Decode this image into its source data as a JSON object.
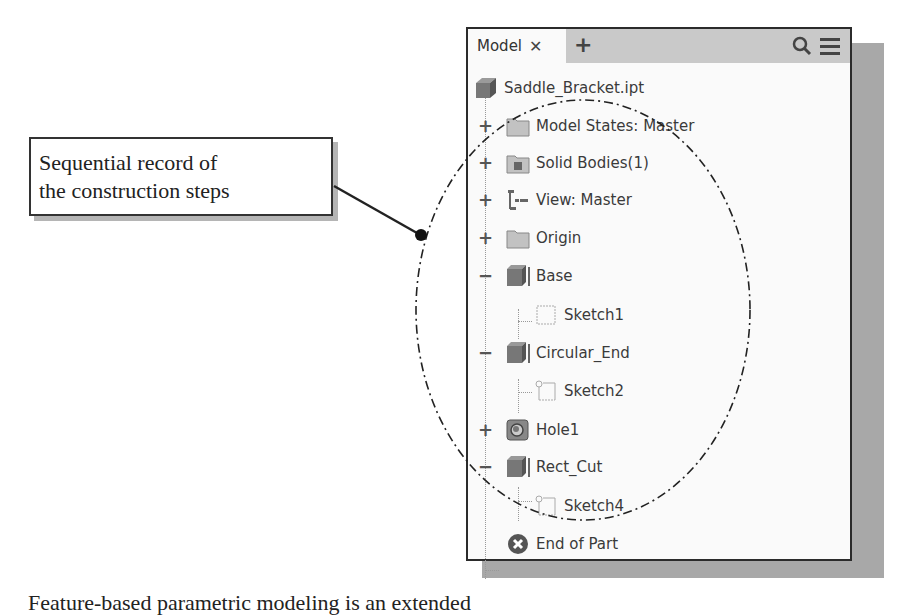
{
  "panel": {
    "tabs": [
      {
        "label": "Model",
        "close_icon": "close-icon"
      }
    ],
    "add_tab_icon": "plus-icon",
    "search_icon": "search-icon",
    "menu_icon": "hamburger-menu-icon"
  },
  "tree": {
    "root": {
      "label": "Saddle_Bracket.ipt",
      "icon": "part-icon"
    },
    "items": [
      {
        "label": "Model States: Master",
        "icon": "folder-icon",
        "expander": "+",
        "level": 1
      },
      {
        "label": "Solid Bodies(1)",
        "icon": "solid-bodies-folder-icon",
        "expander": "+",
        "level": 1
      },
      {
        "label": "View: Master",
        "icon": "view-rep-icon",
        "expander": "+",
        "level": 1
      },
      {
        "label": "Origin",
        "icon": "folder-icon",
        "expander": "+",
        "level": 1
      },
      {
        "label": "Base",
        "icon": "extrude-icon",
        "expander": "−",
        "level": 1
      },
      {
        "label": "Sketch1",
        "icon": "sketch-icon",
        "expander": "",
        "level": 2
      },
      {
        "label": "Circular_End",
        "icon": "extrude-icon",
        "expander": "−",
        "level": 1
      },
      {
        "label": "Sketch2",
        "icon": "sketch-icon",
        "expander": "",
        "level": 2
      },
      {
        "label": "Hole1",
        "icon": "hole-icon",
        "expander": "+",
        "level": 1
      },
      {
        "label": "Rect_Cut",
        "icon": "extrude-icon",
        "expander": "−",
        "level": 1
      },
      {
        "label": "Sketch4",
        "icon": "sketch-icon",
        "expander": "",
        "level": 2
      },
      {
        "label": "End of Part",
        "icon": "end-of-part-icon",
        "expander": "",
        "level": 1
      }
    ]
  },
  "callout": {
    "line1": "Sequential record of",
    "line2": "the construction steps"
  },
  "caption_partial": "Feature-based parametric modeling is an extended"
}
